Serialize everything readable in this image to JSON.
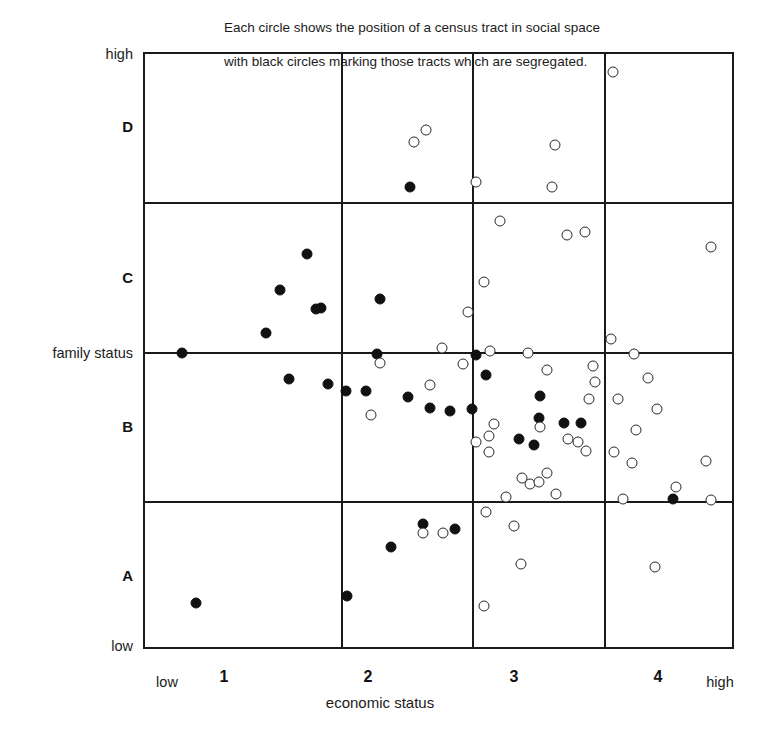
{
  "caption": {
    "line1": "Each circle shows the position of a census tract in social space",
    "line2": "with black circles marking those tracts which are segregated."
  },
  "axes": {
    "y_title": "family status",
    "y_high": "high",
    "y_low": "low",
    "y_bands": [
      "D",
      "C",
      "B",
      "A"
    ],
    "x_title": "economic status",
    "x_low": "low",
    "x_high": "high",
    "x_ticks": [
      "1",
      "2",
      "3",
      "4"
    ]
  },
  "legend": {
    "filled_meaning": "segregated tract",
    "open_meaning": "census tract"
  },
  "colors": {
    "ink": "#111111",
    "frame": "#1a1a1a",
    "background": "#ffffff"
  },
  "chart_data": {
    "type": "scatter",
    "title": "",
    "subtitle": "Each circle shows the position of a census tract in social space with black circles marking those tracts which are segregated.",
    "xlabel": "economic status",
    "ylabel": "family status",
    "xlim": [
      0,
      4.5
    ],
    "ylim": [
      0,
      4
    ],
    "grid": true,
    "legend_position": "none",
    "x_tick_values": [
      1,
      2,
      3,
      4
    ],
    "x_tick_labels": [
      "1",
      "2",
      "3",
      "4"
    ],
    "x_endpoint_labels": [
      "low",
      "high"
    ],
    "y_band_labels": [
      "A",
      "B",
      "C",
      "D"
    ],
    "y_endpoint_labels": [
      "low",
      "high"
    ],
    "x_gridlines": [
      1.5,
      2.5,
      3.5
    ],
    "y_gridlines": [
      1,
      2,
      3
    ],
    "series": [
      {
        "name": "segregated",
        "marker": "filled-circle",
        "color": "#111111",
        "points": [
          [
            2.02,
            3.11
          ],
          [
            1.23,
            2.66
          ],
          [
            1.03,
            2.42
          ],
          [
            1.3,
            2.29
          ],
          [
            1.34,
            2.3
          ],
          [
            0.92,
            2.13
          ],
          [
            1.79,
            2.36
          ],
          [
            0.28,
            2.0
          ],
          [
            1.77,
            1.99
          ],
          [
            2.52,
            1.98
          ],
          [
            1.1,
            1.82
          ],
          [
            1.39,
            1.79
          ],
          [
            1.53,
            1.74
          ],
          [
            1.68,
            1.74
          ],
          [
            2.6,
            1.85
          ],
          [
            2.0,
            1.7
          ],
          [
            2.17,
            1.63
          ],
          [
            2.32,
            1.61
          ],
          [
            2.49,
            1.62
          ],
          [
            3.01,
            1.71
          ],
          [
            3.0,
            1.56
          ],
          [
            3.19,
            1.53
          ],
          [
            3.32,
            1.53
          ],
          [
            2.85,
            1.42
          ],
          [
            2.96,
            1.38
          ],
          [
            4.02,
            1.02
          ],
          [
            2.12,
            0.85
          ],
          [
            2.36,
            0.82
          ],
          [
            1.87,
            0.7
          ],
          [
            1.54,
            0.37
          ],
          [
            0.39,
            0.32
          ]
        ]
      },
      {
        "name": "non-segregated",
        "marker": "open-circle",
        "color": "#2a2a2a",
        "points": [
          [
            3.56,
            3.88
          ],
          [
            2.14,
            3.49
          ],
          [
            2.05,
            3.41
          ],
          [
            3.12,
            3.39
          ],
          [
            2.52,
            3.14
          ],
          [
            3.1,
            3.11
          ],
          [
            2.7,
            2.88
          ],
          [
            3.21,
            2.79
          ],
          [
            3.35,
            2.81
          ],
          [
            4.31,
            2.71
          ],
          [
            2.58,
            2.47
          ],
          [
            2.46,
            2.27
          ],
          [
            3.55,
            2.09
          ],
          [
            2.26,
            2.03
          ],
          [
            2.63,
            2.01
          ],
          [
            2.92,
            2.0
          ],
          [
            3.72,
            1.99
          ],
          [
            1.79,
            1.93
          ],
          [
            2.42,
            1.92
          ],
          [
            3.06,
            1.88
          ],
          [
            3.41,
            1.91
          ],
          [
            3.43,
            1.8
          ],
          [
            3.83,
            1.83
          ],
          [
            2.17,
            1.78
          ],
          [
            3.38,
            1.69
          ],
          [
            3.6,
            1.69
          ],
          [
            3.9,
            1.62
          ],
          [
            1.72,
            1.58
          ],
          [
            2.66,
            1.52
          ],
          [
            3.01,
            1.5
          ],
          [
            3.74,
            1.48
          ],
          [
            2.62,
            1.44
          ],
          [
            3.22,
            1.42
          ],
          [
            3.3,
            1.4
          ],
          [
            3.36,
            1.34
          ],
          [
            2.52,
            1.4
          ],
          [
            2.62,
            1.33
          ],
          [
            3.57,
            1.33
          ],
          [
            3.71,
            1.26
          ],
          [
            4.27,
            1.27
          ],
          [
            4.04,
            1.1
          ],
          [
            2.87,
            1.16
          ],
          [
            2.93,
            1.12
          ],
          [
            3.0,
            1.13
          ],
          [
            3.06,
            1.19
          ],
          [
            3.13,
            1.05
          ],
          [
            2.75,
            1.03
          ],
          [
            3.64,
            1.02
          ],
          [
            4.31,
            1.01
          ],
          [
            2.6,
            0.93
          ],
          [
            2.81,
            0.84
          ],
          [
            2.12,
            0.79
          ],
          [
            2.27,
            0.79
          ],
          [
            2.86,
            0.58
          ],
          [
            3.88,
            0.56
          ],
          [
            2.58,
            0.3
          ]
        ]
      }
    ]
  }
}
